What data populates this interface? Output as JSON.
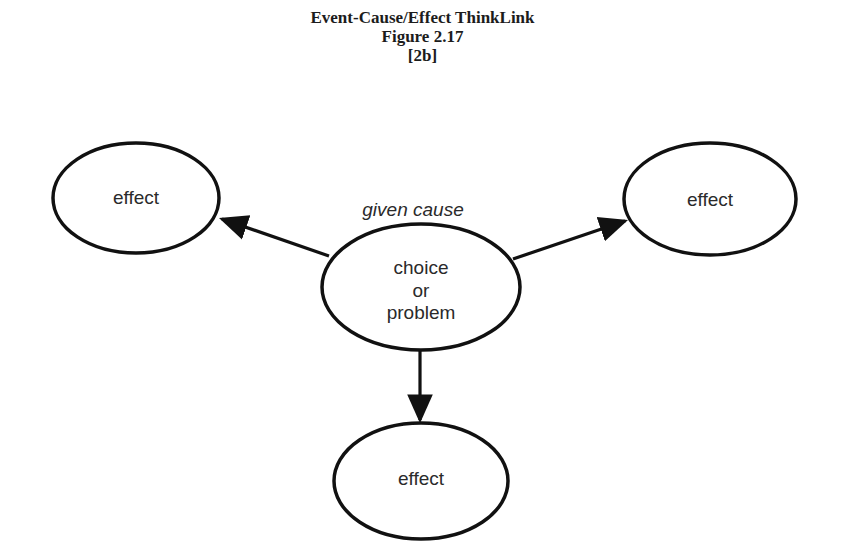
{
  "header": {
    "title": "Event-Cause/Effect ThinkLink",
    "figure": "Figure 2.17",
    "tag": "[2b]"
  },
  "diagram": {
    "cause_label": "given cause",
    "center_node": {
      "line1": "choice",
      "line2": "or",
      "line3": "problem"
    },
    "effect_nodes": [
      {
        "label": "effect",
        "position": "left"
      },
      {
        "label": "effect",
        "position": "right"
      },
      {
        "label": "effect",
        "position": "bottom"
      }
    ],
    "colors": {
      "stroke": "#111111",
      "text": "#2a2a2a",
      "background": "#ffffff"
    }
  }
}
